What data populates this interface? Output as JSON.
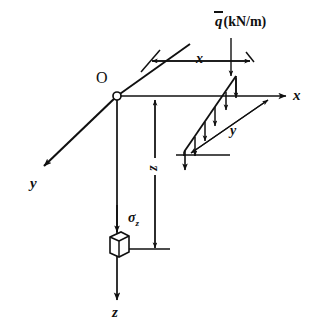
{
  "figure": {
    "type": "engineering-diagram",
    "background_color": "#ffffff",
    "ink_color": "#101010",
    "width": 325,
    "height": 333
  },
  "origin": {
    "label": "O",
    "marker": "open-circle"
  },
  "axes": [
    {
      "id": "x",
      "label": "x",
      "direction": "right",
      "arrow": "single-head"
    },
    {
      "id": "y",
      "label": "y",
      "direction": "down-left",
      "arrow": "single-head"
    },
    {
      "id": "z",
      "label": "z",
      "direction": "down",
      "arrow": "single-head"
    }
  ],
  "load": {
    "symbol": "q",
    "symbol_overbar": true,
    "units": "(kN/m)",
    "full_label": "q̄ (kN/m)",
    "arrow_count": 6,
    "leader": "down-arrow-to-load-strip",
    "shape": "parallelogram-strip"
  },
  "dimensions": [
    {
      "id": "x-dimension",
      "label": "x",
      "orientation": "horizontal",
      "arrow": "double-head",
      "measures": "distance from y-axis plane to load line"
    },
    {
      "id": "y-dimension",
      "label": "y",
      "orientation": "diagonal",
      "arrow": "double-head",
      "measures": "length of loaded line along y"
    },
    {
      "id": "z-dimension",
      "label": "z",
      "orientation": "vertical",
      "arrow": "double-head",
      "measures": "depth below origin to stress element"
    }
  ],
  "stress_element": {
    "label": "σ",
    "subscript": "z",
    "full_label": "σz",
    "shape": "cube",
    "arrow": "down-arrow-onto-cube"
  }
}
